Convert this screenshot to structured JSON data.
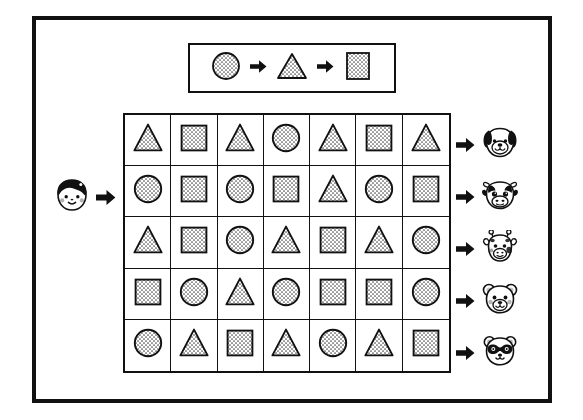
{
  "worksheet": {
    "title": "Shape Sequence Pattern Worksheet",
    "frame_color": "#111111",
    "background_color": "#ffffff"
  },
  "legend": {
    "name": "shape-sequence-key",
    "sequence": [
      {
        "shape": "circle",
        "fill": "dotted",
        "label": "circle"
      },
      {
        "connector": "arrow-right",
        "label": "then"
      },
      {
        "shape": "triangle",
        "fill": "dotted",
        "label": "triangle"
      },
      {
        "connector": "arrow-right",
        "label": "then"
      },
      {
        "shape": "square",
        "fill": "dotted",
        "label": "square"
      }
    ]
  },
  "start_marker": {
    "icon": "boy-face-icon",
    "label": "boy",
    "arrow": "arrow-right"
  },
  "grid": {
    "columns": 7,
    "rows": 5,
    "cell_fill": "dotted",
    "rows_data": [
      {
        "row": 1,
        "cells": [
          "triangle",
          "square",
          "triangle",
          "circle",
          "triangle",
          "square",
          "triangle"
        ],
        "arrow": "arrow-right",
        "animal": "dog-face-icon",
        "animal_label": "dog"
      },
      {
        "row": 2,
        "cells": [
          "circle",
          "square",
          "circle",
          "square",
          "triangle",
          "circle",
          "square"
        ],
        "arrow": "arrow-right",
        "animal": "cow-face-icon",
        "animal_label": "cow"
      },
      {
        "row": 3,
        "cells": [
          "triangle",
          "square",
          "circle",
          "triangle",
          "square",
          "triangle",
          "circle"
        ],
        "arrow": "arrow-right",
        "animal": "giraffe-face-icon",
        "animal_label": "giraffe"
      },
      {
        "row": 4,
        "cells": [
          "square",
          "circle",
          "triangle",
          "circle",
          "square",
          "square",
          "circle"
        ],
        "arrow": "arrow-right",
        "animal": "bear-face-icon",
        "animal_label": "bear"
      },
      {
        "row": 5,
        "cells": [
          "circle",
          "triangle",
          "square",
          "triangle",
          "circle",
          "triangle",
          "square"
        ],
        "arrow": "arrow-right",
        "animal": "panda-face-icon",
        "animal_label": "panda"
      }
    ]
  }
}
